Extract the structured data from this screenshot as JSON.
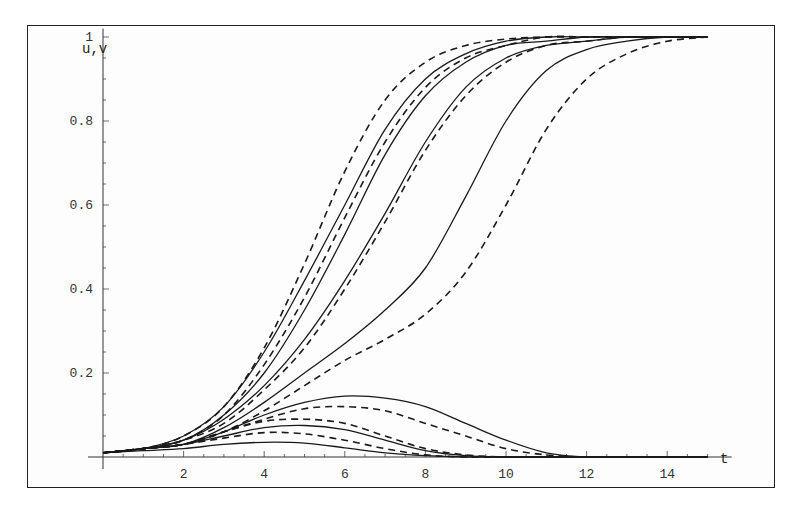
{
  "chart_data": {
    "type": "line",
    "title": "",
    "xlabel": "t",
    "ylabel": "u,v",
    "xlim": [
      0,
      15
    ],
    "ylim": [
      0,
      1
    ],
    "grid": false,
    "legend": null,
    "x_ticks": [
      2,
      4,
      6,
      8,
      10,
      12,
      14
    ],
    "x_tick_labels": [
      "2",
      "4",
      "6",
      "8",
      "10",
      "12",
      "14"
    ],
    "y_ticks": [
      0.2,
      0.4,
      0.6,
      0.8,
      1
    ],
    "y_tick_labels": [
      "0.2",
      "0.4",
      "0.6",
      "0.8",
      "1"
    ],
    "x": [
      0,
      1,
      2,
      3,
      4,
      5,
      6,
      7,
      8,
      9,
      10,
      11,
      12,
      13,
      14,
      15
    ],
    "series": [
      {
        "name": "u dashed 1",
        "style": "dashed",
        "values": [
          0.01,
          0.02,
          0.05,
          0.12,
          0.26,
          0.46,
          0.68,
          0.85,
          0.94,
          0.98,
          0.995,
          1,
          1,
          1,
          1,
          1
        ]
      },
      {
        "name": "u solid 1",
        "style": "solid",
        "values": [
          0.01,
          0.02,
          0.05,
          0.12,
          0.25,
          0.42,
          0.6,
          0.78,
          0.9,
          0.96,
          0.99,
          1,
          1,
          1,
          1,
          1
        ]
      },
      {
        "name": "u dashed 2",
        "style": "dashed",
        "values": [
          0.01,
          0.02,
          0.04,
          0.1,
          0.22,
          0.38,
          0.57,
          0.75,
          0.88,
          0.95,
          0.98,
          1,
          1,
          1,
          1,
          1
        ]
      },
      {
        "name": "u solid 2",
        "style": "solid",
        "values": [
          0.01,
          0.02,
          0.04,
          0.1,
          0.2,
          0.35,
          0.53,
          0.72,
          0.86,
          0.94,
          0.98,
          0.99,
          1,
          1,
          1,
          1
        ]
      },
      {
        "name": "u solid 3",
        "style": "solid",
        "values": [
          0.01,
          0.02,
          0.04,
          0.09,
          0.17,
          0.28,
          0.42,
          0.58,
          0.75,
          0.88,
          0.95,
          0.98,
          0.99,
          1,
          1,
          1
        ]
      },
      {
        "name": "u dashed 3",
        "style": "dashed",
        "values": [
          0.01,
          0.02,
          0.04,
          0.08,
          0.16,
          0.26,
          0.4,
          0.56,
          0.73,
          0.86,
          0.94,
          0.98,
          0.99,
          1,
          1,
          1
        ]
      },
      {
        "name": "u solid 4",
        "style": "solid",
        "values": [
          0.01,
          0.02,
          0.03,
          0.07,
          0.13,
          0.2,
          0.27,
          0.35,
          0.45,
          0.62,
          0.8,
          0.92,
          0.97,
          0.99,
          1,
          1
        ]
      },
      {
        "name": "u dashed 4",
        "style": "dashed",
        "values": [
          0.01,
          0.02,
          0.03,
          0.06,
          0.11,
          0.17,
          0.23,
          0.28,
          0.34,
          0.44,
          0.6,
          0.78,
          0.9,
          0.96,
          0.99,
          1
        ]
      },
      {
        "name": "v solid 1",
        "style": "solid",
        "values": [
          0.01,
          0.02,
          0.03,
          0.06,
          0.1,
          0.13,
          0.145,
          0.14,
          0.12,
          0.08,
          0.04,
          0.01,
          0,
          0,
          0,
          0
        ]
      },
      {
        "name": "v dashed 1",
        "style": "dashed",
        "values": [
          0.01,
          0.02,
          0.03,
          0.06,
          0.09,
          0.115,
          0.12,
          0.11,
          0.08,
          0.05,
          0.02,
          0.005,
          0,
          0,
          0,
          0
        ]
      },
      {
        "name": "v dashed 2",
        "style": "dashed",
        "values": [
          0.01,
          0.02,
          0.03,
          0.06,
          0.085,
          0.09,
          0.08,
          0.05,
          0.02,
          0.005,
          0,
          0,
          0,
          0,
          0,
          0
        ]
      },
      {
        "name": "v solid 2",
        "style": "solid",
        "values": [
          0.01,
          0.02,
          0.03,
          0.05,
          0.07,
          0.075,
          0.065,
          0.04,
          0.015,
          0.003,
          0,
          0,
          0,
          0,
          0,
          0
        ]
      },
      {
        "name": "v dashed 3",
        "style": "dashed",
        "values": [
          0.01,
          0.02,
          0.03,
          0.045,
          0.058,
          0.055,
          0.04,
          0.02,
          0.005,
          0,
          0,
          0,
          0,
          0,
          0,
          0
        ]
      },
      {
        "name": "v solid 3",
        "style": "solid",
        "values": [
          0.01,
          0.015,
          0.02,
          0.03,
          0.035,
          0.033,
          0.022,
          0.01,
          0.003,
          0,
          0,
          0,
          0,
          0,
          0,
          0
        ]
      }
    ]
  },
  "axes": {
    "y_label": "u,v",
    "x_label": "t"
  }
}
